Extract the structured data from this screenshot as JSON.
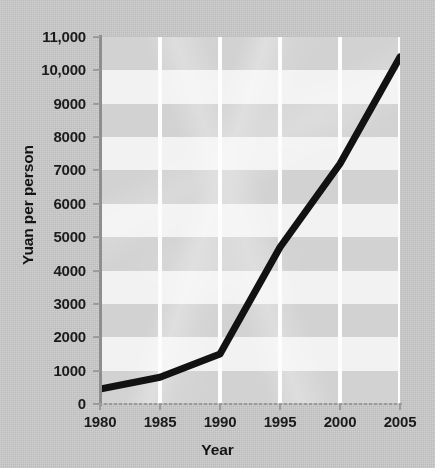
{
  "chart_data": {
    "type": "line",
    "title": "",
    "xlabel": "Year",
    "ylabel": "Yuan per person",
    "x": [
      1980,
      1985,
      1990,
      1995,
      2000,
      2005
    ],
    "values": [
      450,
      800,
      1500,
      4700,
      7200,
      10400
    ],
    "series": [
      {
        "name": "Yuan per person",
        "values": [
          450,
          800,
          1500,
          4700,
          7200,
          10400
        ]
      }
    ],
    "xlim": [
      1980,
      2005
    ],
    "ylim": [
      0,
      11000
    ],
    "y_ticks": [
      0,
      1000,
      2000,
      3000,
      4000,
      5000,
      6000,
      7000,
      8000,
      9000,
      10000,
      11000
    ],
    "y_tick_labels": [
      "0",
      "1000",
      "2000",
      "3000",
      "4000",
      "5000",
      "6000",
      "7000",
      "8000",
      "9000",
      "10,000",
      "11,000"
    ],
    "x_ticks": [
      1980,
      1985,
      1990,
      1995,
      2000,
      2005
    ],
    "x_tick_labels": [
      "1980",
      "1985",
      "1990",
      "1995",
      "2000",
      "2005"
    ],
    "grid": "vertical white gridlines at each x tick; alternating horizontal shaded bands every 1000 units",
    "legend": "none",
    "legend_position": "none",
    "annotations": []
  },
  "style": {
    "background_color": "#c9c9c9",
    "band_color_dark": "#d2d2d2",
    "band_color_light": "#f2f2f2",
    "gridline_color": "#fdfdfd",
    "line_color": "#121212",
    "axis_color": "#8e8e8e",
    "text_color": "#1b1b1b"
  },
  "axis_titles": {
    "y": "Yuan per person",
    "x": "Year"
  }
}
